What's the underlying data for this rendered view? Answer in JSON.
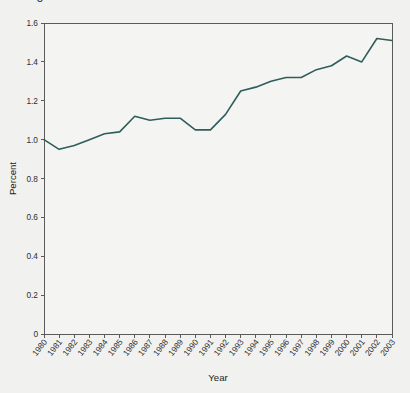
{
  "figure": {
    "clipped_title": "Figure 1. Percent ...",
    "background_color": "#f1f1ef",
    "plot_background_color": "#f4f4f2",
    "axis_color": "#5a5a5a"
  },
  "chart_data": {
    "type": "line",
    "title": "",
    "xlabel": "Year",
    "ylabel": "Percent",
    "line_color": "#2f5d5b",
    "grid": false,
    "legend": null,
    "xlim": [
      1980,
      2003
    ],
    "ylim": [
      0,
      1.6
    ],
    "ytick_labels": [
      "0",
      "0.2",
      "0.4",
      "0.6",
      "0.8",
      "1.0",
      "1.2",
      "1.4",
      "1.6"
    ],
    "ytick_values": [
      0,
      0.2,
      0.4,
      0.6,
      0.8,
      1.0,
      1.2,
      1.4,
      1.6
    ],
    "categories": [
      "1980",
      "1981",
      "1982",
      "1983",
      "1984",
      "1985",
      "1986",
      "1987",
      "1988",
      "1989",
      "1990",
      "1991",
      "1992",
      "1993",
      "1994",
      "1995",
      "1996",
      "1997",
      "1998",
      "1999",
      "2000",
      "2001",
      "2002",
      "2003"
    ],
    "x": [
      1980,
      1981,
      1982,
      1983,
      1984,
      1985,
      1986,
      1987,
      1988,
      1989,
      1990,
      1991,
      1992,
      1993,
      1994,
      1995,
      1996,
      1997,
      1998,
      1999,
      2000,
      2001,
      2002,
      2003
    ],
    "values": [
      1.0,
      0.95,
      0.97,
      1.0,
      1.03,
      1.04,
      1.12,
      1.1,
      1.11,
      1.11,
      1.05,
      1.05,
      1.13,
      1.25,
      1.27,
      1.3,
      1.32,
      1.32,
      1.36,
      1.38,
      1.43,
      1.4,
      1.52,
      1.51
    ],
    "series": [
      {
        "name": "Percent",
        "values": [
          1.0,
          0.95,
          0.97,
          1.0,
          1.03,
          1.04,
          1.12,
          1.1,
          1.11,
          1.11,
          1.05,
          1.05,
          1.13,
          1.25,
          1.27,
          1.3,
          1.32,
          1.32,
          1.36,
          1.38,
          1.43,
          1.4,
          1.52,
          1.51
        ]
      }
    ]
  }
}
